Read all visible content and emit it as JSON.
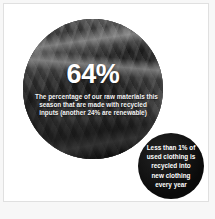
{
  "card": {
    "background_color": "#ffffff",
    "border_color": "#e0e0e0"
  },
  "main_stat": {
    "value": "64%",
    "description_lines": [
      "The percentage of our raw materials this",
      "season that are made with recycled",
      "inputs (another 24% are renewable)"
    ],
    "image_alt": "pile-of-textiles-photo",
    "text_color": "#ffffff"
  },
  "secondary_stat": {
    "lines": [
      "Less than 1% of",
      "used clothing is",
      "recycled into",
      "new clothing",
      "every year",
      ""
    ],
    "background_color": "#0d0d0d",
    "text_color": "#ffffff"
  }
}
